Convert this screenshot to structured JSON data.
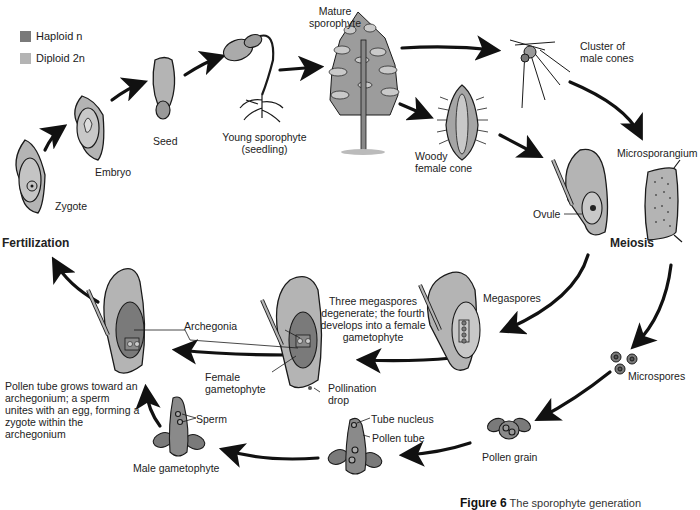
{
  "legend": {
    "items": [
      {
        "label": "Haploid n",
        "color": "#7a7a7a"
      },
      {
        "label": "Diploid 2n",
        "color": "#b4b4b4"
      }
    ]
  },
  "stages": {
    "mature_sporophyte": "Mature sporophyte",
    "cluster_male_cones": "Cluster of male cones",
    "microsporangium": "Microsporangium",
    "woody_female_cone": "Woody female cone",
    "ovule": "Ovule",
    "meiosis": "Meiosis",
    "young_sporophyte": "Young sporophyte (seedling)",
    "seed": "Seed",
    "embryo": "Embryo",
    "zygote": "Zygote",
    "fertilization": "Fertilization",
    "megaspores": "Megaspores",
    "three_megaspores_note": "Three megaspores degenerate; the fourth develops into a female gametophyte",
    "microspores": "Microspores",
    "pollen_grain": "Pollen grain",
    "tube_nucleus": "Tube nucleus",
    "pollen_tube": "Pollen tube",
    "archegonia": "Archegonia",
    "female_gametophyte": "Female gametophyte",
    "pollination_drop": "Pollination drop",
    "sperm": "Sperm",
    "male_gametophyte": "Male gametophyte",
    "pollen_tube_note": "Pollen tube grows toward an archegonium; a sperm unites with an egg, forming a zygote within the archegonium"
  },
  "caption": {
    "figure": "Figure 6",
    "text": "The sporophyte generation"
  },
  "colors": {
    "haploid": "#7a7a7a",
    "diploid": "#b4b4b4",
    "outline": "#1a1a1a",
    "arrow": "#111111"
  }
}
